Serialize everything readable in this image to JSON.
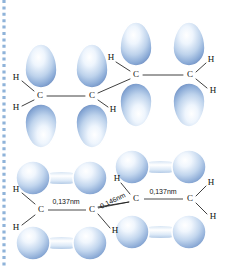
{
  "figure": {
    "title_alt": "pi orbital diagram of 1,3-butadiene",
    "background_color": "#ffffff",
    "orbital_fill_light": "#f2f7fd",
    "orbital_fill_mid": "#b9cfeb",
    "orbital_fill_dark": "#7b9fd0",
    "orbital_outline": "#ffffff",
    "bond_color": "#2a2a2a",
    "label_color": "#121212",
    "edge_dot_color": "#8fb3d9"
  },
  "top_structure": {
    "name": "sp2-hybrid-p-orbital-chain",
    "atom_labels": [
      {
        "id": "h-left-upper",
        "text": "H",
        "x": 16,
        "y": 78
      },
      {
        "id": "h-left-lower",
        "text": "H",
        "x": 16,
        "y": 108
      },
      {
        "id": "c-1",
        "text": "C",
        "x": 40,
        "y": 96
      },
      {
        "id": "c-2",
        "text": "C",
        "x": 92,
        "y": 96
      },
      {
        "id": "h-mid-upper",
        "text": "H",
        "x": 111,
        "y": 58
      },
      {
        "id": "h-mid-lower",
        "text": "H",
        "x": 113,
        "y": 110
      },
      {
        "id": "c-3",
        "text": "C",
        "x": 136,
        "y": 75
      },
      {
        "id": "c-4",
        "text": "C",
        "x": 190,
        "y": 75
      },
      {
        "id": "h-right-upper",
        "text": "H",
        "x": 211,
        "y": 60
      },
      {
        "id": "h-right-lower",
        "text": "H",
        "x": 213,
        "y": 91
      }
    ],
    "lobes": [
      {
        "id": "lobe-c1-up",
        "cx": 41,
        "cy": 66,
        "rx": 16,
        "ry": 22,
        "flip": false
      },
      {
        "id": "lobe-c1-down",
        "cx": 41,
        "cy": 126,
        "rx": 16,
        "ry": 22,
        "flip": true
      },
      {
        "id": "lobe-c2-up",
        "cx": 92,
        "cy": 66,
        "rx": 16,
        "ry": 22,
        "flip": false
      },
      {
        "id": "lobe-c2-down",
        "cx": 92,
        "cy": 126,
        "rx": 16,
        "ry": 22,
        "flip": true
      },
      {
        "id": "lobe-c3-up",
        "cx": 136,
        "cy": 44,
        "rx": 16,
        "ry": 22,
        "flip": false
      },
      {
        "id": "lobe-c3-down",
        "cx": 136,
        "cy": 105,
        "rx": 16,
        "ry": 22,
        "flip": true
      },
      {
        "id": "lobe-c4-up",
        "cx": 189,
        "cy": 44,
        "rx": 16,
        "ry": 22,
        "flip": false
      },
      {
        "id": "lobe-c4-down",
        "cx": 189,
        "cy": 105,
        "rx": 16,
        "ry": 22,
        "flip": true
      }
    ]
  },
  "bottom_structure": {
    "name": "delocalized-pi-orbital-chain",
    "atom_labels": [
      {
        "id": "b-h-left-upper",
        "text": "H",
        "x": 16,
        "y": 190
      },
      {
        "id": "b-h-left-lower",
        "text": "H",
        "x": 16,
        "y": 228
      },
      {
        "id": "b-c-1",
        "text": "C",
        "x": 41,
        "y": 210
      },
      {
        "id": "b-c-2",
        "text": "C",
        "x": 92,
        "y": 210
      },
      {
        "id": "b-h-mid-upper",
        "text": "H",
        "x": 117,
        "y": 179
      },
      {
        "id": "b-h-mid-lower",
        "text": "H",
        "x": 115,
        "y": 231
      },
      {
        "id": "b-c-3",
        "text": "C",
        "x": 136,
        "y": 199
      },
      {
        "id": "b-c-4",
        "text": "C",
        "x": 190,
        "y": 199
      },
      {
        "id": "b-h-right-upper",
        "text": "H",
        "x": 211,
        "y": 183
      },
      {
        "id": "b-h-right-lower",
        "text": "H",
        "x": 213,
        "y": 217
      }
    ],
    "dimensions": [
      {
        "id": "bond-length-c1-c2",
        "text": "0,137nm",
        "x": 66,
        "y": 202,
        "rotate": 0,
        "line": {
          "x1": 48,
          "y1": 210,
          "x2": 86,
          "y2": 210
        }
      },
      {
        "id": "bond-length-c2-c3",
        "text": "0,146nm",
        "x": 113,
        "y": 201,
        "rotate": -26,
        "line": {
          "x1": 98,
          "y1": 208,
          "x2": 129,
          "y2": 202
        }
      },
      {
        "id": "bond-length-c3-c4",
        "text": "0,137nm",
        "x": 163,
        "y": 192,
        "rotate": 0,
        "line": {
          "x1": 144,
          "y1": 199,
          "x2": 183,
          "y2": 199
        }
      }
    ],
    "dumbbells": [
      {
        "id": "db-c1c2-up",
        "x1": 33,
        "y1": 178,
        "x2": 90,
        "y2": 178,
        "r": 17
      },
      {
        "id": "db-c1c2-down",
        "x1": 33,
        "y1": 243,
        "x2": 90,
        "y2": 243,
        "r": 17
      },
      {
        "id": "db-c3c4-up",
        "x1": 132,
        "y1": 167,
        "x2": 189,
        "y2": 167,
        "r": 17
      },
      {
        "id": "db-c3c4-down",
        "x1": 132,
        "y1": 232,
        "x2": 189,
        "y2": 232,
        "r": 17
      }
    ]
  },
  "edge_marker": {
    "name": "page-edge-dotted-rule",
    "dot_count": 42
  }
}
